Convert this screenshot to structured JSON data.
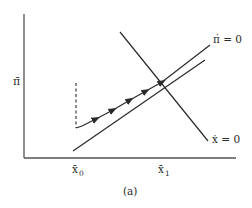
{
  "diagram": {
    "y_axis_label": "π̄",
    "x_ticks": [
      {
        "label": "x̄",
        "sub": "0"
      },
      {
        "label": "x̄",
        "sub": "1"
      }
    ],
    "curves": {
      "pi_dot_zero": "π̇ = 0",
      "x_dot_zero": "ẋ = 0"
    },
    "caption": "(a)",
    "colors": {
      "line": "#2a2a2a",
      "background": "#ffffff"
    }
  }
}
